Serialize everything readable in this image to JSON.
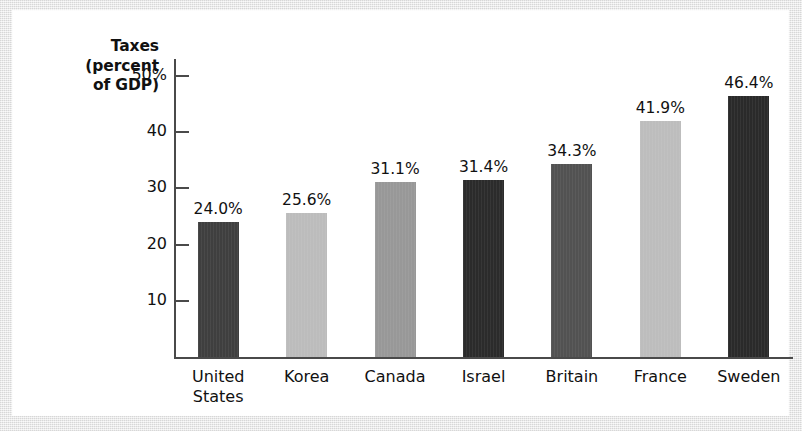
{
  "chart_data": {
    "type": "bar",
    "title": "",
    "axis_title_lines": [
      "Taxes",
      "(percent",
      "of GDP)"
    ],
    "ylabel": "Taxes (percent of GDP)",
    "xlabel": "",
    "categories": [
      "United States",
      "Korea",
      "Canada",
      "Israel",
      "Britain",
      "France",
      "Sweden"
    ],
    "category_label_lines": [
      [
        "United",
        "States"
      ],
      [
        "Korea",
        ""
      ],
      [
        "Canada",
        ""
      ],
      [
        "Israel",
        ""
      ],
      [
        "Britain",
        ""
      ],
      [
        "France",
        ""
      ],
      [
        "Sweden",
        ""
      ]
    ],
    "values": [
      24.0,
      25.6,
      31.1,
      31.4,
      34.3,
      41.9,
      46.4
    ],
    "value_labels": [
      "24.0%",
      "25.6%",
      "31.1%",
      "31.4%",
      "34.3%",
      "41.9%",
      "46.4%"
    ],
    "bar_colors": [
      "#3f3f3f",
      "#bcbcbc",
      "#989898",
      "#2b2b2b",
      "#525252",
      "#bdbdbd",
      "#2a2a2a"
    ],
    "ylim": [
      0,
      53
    ],
    "yticks": [
      10,
      20,
      30,
      40,
      50
    ],
    "ytick_labels": [
      "10",
      "20",
      "30",
      "40",
      "50%"
    ],
    "grid": false,
    "legend": "none"
  },
  "style": {
    "panel_background": "#ffffff",
    "page_background": "#eaeaea",
    "axis_color": "#4a4a4a",
    "text_color": "#111111"
  }
}
